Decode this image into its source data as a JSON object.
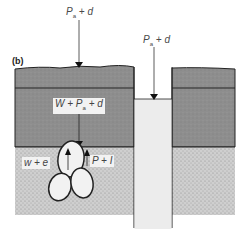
{
  "panel_label": "(b)",
  "labels": {
    "surface_load": "P",
    "surface_load_sub": "a",
    "surface_load_suffix": " + d",
    "hole_load": "P",
    "hole_load_sub": "a",
    "hole_load_suffix": " + d",
    "overburden": "W + P",
    "overburden_sub": "a",
    "overburden_suffix": " + d",
    "left_force": "w + e",
    "right_force": "P + I"
  },
  "colors": {
    "overburden_fill": "#8a8a8a",
    "sediment_fill": "#c6c6c6",
    "hole_fill": "#ececec",
    "outline": "#222222"
  }
}
